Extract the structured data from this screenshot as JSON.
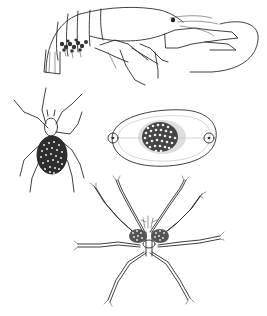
{
  "plate": {
    "background": "#ffffff",
    "ink_color": "#2a2a2a",
    "figures": [
      {
        "id": "crayfish",
        "subject": "crayfish carrying eggs under abdomen",
        "position": "top"
      },
      {
        "id": "spider",
        "subject": "spider carrying egg mass / young on abdomen",
        "position": "middle-left"
      },
      {
        "id": "egg-capsule",
        "subject": "oval egg capsule with central egg cluster",
        "position": "middle-right"
      },
      {
        "id": "sea-spider",
        "subject": "sea spider (pycnogonid) with egg clusters",
        "position": "bottom"
      }
    ]
  }
}
